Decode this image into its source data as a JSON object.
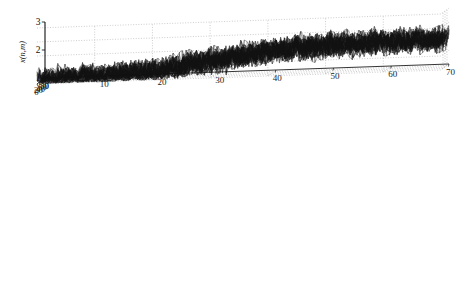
{
  "figure": {
    "background": "#ffffff",
    "ink": "#000000",
    "grid_color": "#9a9a9a",
    "panel_count": 3
  },
  "chart_data": [
    {
      "type": "surface",
      "id": "panel-0",
      "zlabel": "x(n,m)",
      "zticks": [
        "1",
        "2",
        "3"
      ],
      "zlim": [
        1,
        3
      ],
      "xticks_left": [
        "80",
        "60",
        "40",
        "20",
        "0"
      ],
      "xlim_left": [
        0,
        80
      ],
      "yticks_right": [
        "0",
        "10",
        "20",
        "30",
        "40",
        "50",
        "60",
        "70"
      ],
      "ylim_right": [
        0,
        70
      ],
      "grid": true,
      "description": "noisy 3D mesh surface, heavy random noise, low plateau near 1 rising to a noisy plateau near 2",
      "noise_amplitude": 0.55,
      "plateau_low": 1.0,
      "plateau_high": 2.0,
      "step_position": 0.42
    },
    {
      "type": "surface",
      "id": "panel-1",
      "zlabel": "y0(n,m)",
      "zlabel_base": "y",
      "zlabel_sub": "0",
      "zlabel_args": "(n,m)",
      "zticks": [
        "1",
        "2",
        "3"
      ],
      "zlim": [
        1,
        3
      ],
      "xticks_left": [
        "60",
        "40",
        "20",
        "0"
      ],
      "xlim_left": [
        0,
        60
      ],
      "yticks_right": [
        "0",
        "10",
        "20",
        "30",
        "40",
        "50",
        "60"
      ],
      "ylim_right": [
        0,
        60
      ],
      "grid": true,
      "description": "smooth denoised 3D mesh surface with gradual sloping step from 1 to 2",
      "noise_amplitude": 0.0,
      "plateau_low": 1.0,
      "plateau_high": 2.0,
      "step_position": 0.42,
      "step_sharpness": 0.14
    },
    {
      "type": "surface",
      "id": "panel-2",
      "zlabel": "y0(n,m)",
      "zlabel_base": "y",
      "zlabel_sub": "0",
      "zlabel_args": "(n,m)",
      "zticks": [
        "1",
        "2",
        "3"
      ],
      "zlim": [
        1,
        3
      ],
      "xticks_left": [
        "60",
        "40",
        "20",
        "0"
      ],
      "xlim_left": [
        0,
        60
      ],
      "yticks_right": [
        "0",
        "10",
        "20",
        "30",
        "40",
        "50",
        "60"
      ],
      "ylim_right": [
        0,
        60
      ],
      "grid": true,
      "description": "smooth denoised 3D mesh surface with sharp vertical step edge from 1 to 2",
      "noise_amplitude": 0.0,
      "plateau_low": 1.0,
      "plateau_high": 2.0,
      "step_position": 0.42,
      "step_sharpness": 0.022
    }
  ]
}
